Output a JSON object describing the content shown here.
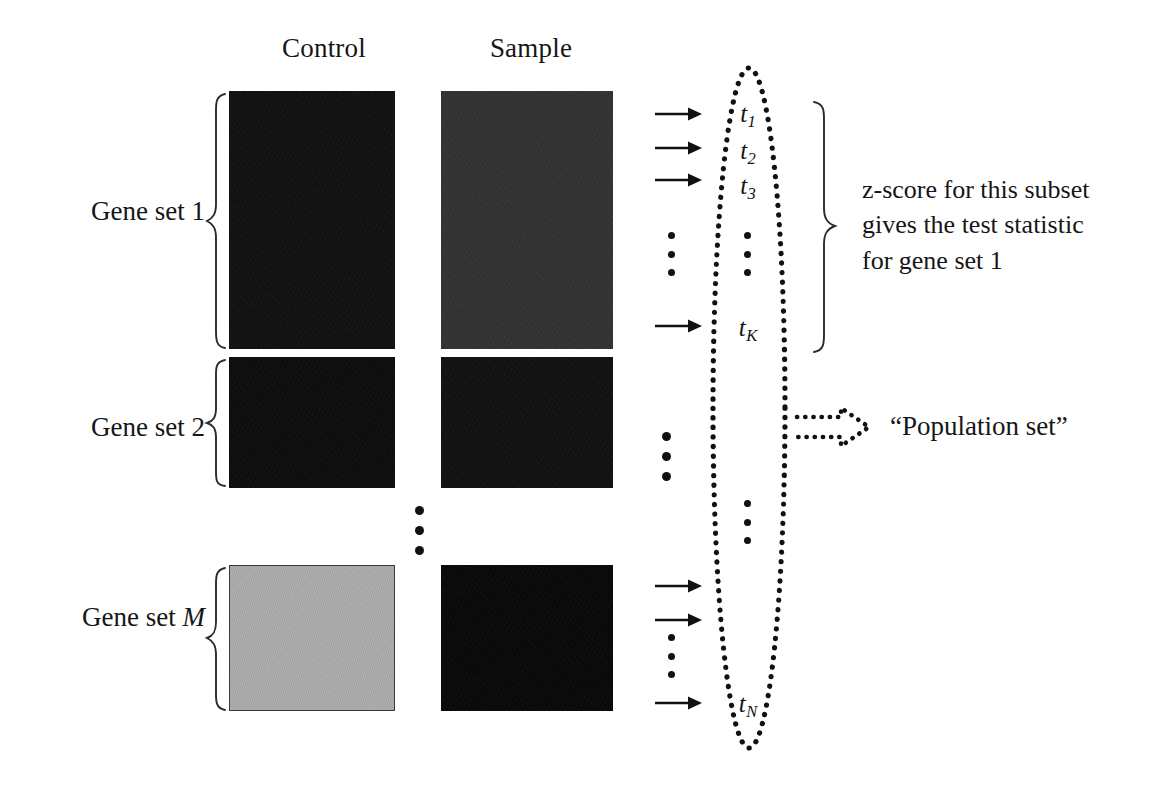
{
  "figure": {
    "type": "diagram"
  },
  "columns": [
    {
      "id": "control",
      "label": "Control"
    },
    {
      "id": "sample",
      "label": "Sample"
    }
  ],
  "rows": [
    {
      "id": "gene-set-1",
      "label": "Gene set 1",
      "label_plain": "Gene set 1",
      "control_shade": "#111111",
      "sample_shade": "#323232"
    },
    {
      "id": "gene-set-2",
      "label": "Gene set 2",
      "label_plain": "Gene set 2",
      "control_shade": "#0c0c0c",
      "sample_shade": "#111111"
    },
    {
      "id": "gene-set-m",
      "label_prefix": "Gene set ",
      "label_italic": "M",
      "label_plain": "Gene set M",
      "control_shade": "#adadad",
      "sample_shade": "#080808"
    }
  ],
  "statistics": {
    "container_name": "population-set-ellipse",
    "items": [
      {
        "id": "t1",
        "base": "t",
        "sub": "1"
      },
      {
        "id": "t2",
        "base": "t",
        "sub": "2"
      },
      {
        "id": "t3",
        "base": "t",
        "sub": "3"
      },
      {
        "id": "tK",
        "base": "t",
        "sub": "K"
      },
      {
        "id": "tN",
        "base": "t",
        "sub": "N"
      }
    ],
    "ellipsis_glyph": "vertical-dots"
  },
  "annotations": {
    "zscore_note": "z-score for this subset\ngives the test statistic\nfor gene set 1",
    "population_set_label": "“Population set”"
  },
  "colors": {
    "ink": "#161616",
    "background": "#ffffff",
    "dotted_stroke": "#111111",
    "brace_stroke": "#2b2b2b",
    "block_border": "#3a3a3a"
  }
}
